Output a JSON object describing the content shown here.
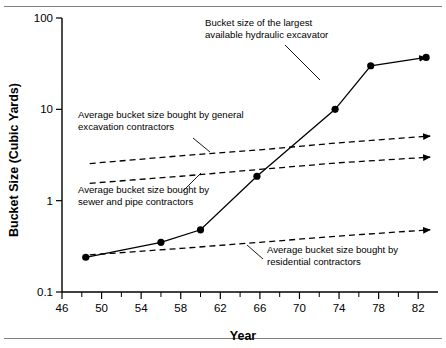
{
  "figure": {
    "name": "bucket-size-vs-year-chart",
    "background": "#ffffff",
    "rule_color": "#808080"
  },
  "chart_data": {
    "type": "line",
    "title": "",
    "xlabel": "Year",
    "ylabel": "Bucket Size (Cubic Yards)",
    "xlim": [
      46,
      84
    ],
    "ylim": [
      0.1,
      100
    ],
    "yscale": "log",
    "xscale": "linear",
    "grid": false,
    "legend": "none (inline annotations)",
    "x_major_ticks": [
      46,
      50,
      54,
      58,
      62,
      66,
      70,
      74,
      78,
      82
    ],
    "x_major_tick_labels": [
      "46",
      "50",
      "54",
      "58",
      "62",
      "66",
      "70",
      "74",
      "78",
      "82"
    ],
    "x_minor_ticks": [
      48,
      52,
      56,
      60,
      64,
      68,
      72,
      76,
      80
    ],
    "y_major_ticks": [
      0.1,
      1,
      10,
      100
    ],
    "y_major_tick_labels": [
      "0.1",
      "1",
      "10",
      "100"
    ],
    "series": [
      {
        "name": "Bucket size of the largest available hydraulic excavator",
        "style": "solid",
        "markers": true,
        "arrow": true,
        "x": [
          48.4,
          56,
          60,
          65.7,
          73.6,
          77.2,
          82.8
        ],
        "y": [
          0.24,
          0.35,
          0.48,
          1.85,
          10.0,
          30.0,
          37.0
        ]
      },
      {
        "name": "Average bucket size bought by general excavation contractors",
        "style": "dashed",
        "markers": false,
        "arrow": true,
        "x": [
          48.8,
          58,
          66,
          74,
          83.2
        ],
        "y": [
          2.55,
          3.1,
          3.6,
          4.3,
          5.1
        ]
      },
      {
        "name": "Average bucket size bought by sewer and pipe contractors",
        "style": "dashed",
        "markers": false,
        "arrow": true,
        "x": [
          48.8,
          58,
          66,
          74,
          83.2
        ],
        "y": [
          1.55,
          1.85,
          2.2,
          2.6,
          3.0
        ]
      },
      {
        "name": "Average bucket size bought by residential contractors",
        "style": "dashed",
        "markers": false,
        "arrow": true,
        "x": [
          48.8,
          58,
          66,
          74,
          83.2
        ],
        "y": [
          0.255,
          0.3,
          0.35,
          0.41,
          0.48
        ]
      }
    ],
    "annotations": [
      {
        "id": "annotation-largest-excavator",
        "line1": "Bucket size of the largest",
        "line2": "available hydraulic excavator",
        "text_x": 205,
        "text_y": 26,
        "leader": [
          285,
          45,
          320,
          80
        ]
      },
      {
        "id": "annotation-general-excavation",
        "line1": "Average bucket size bought by general",
        "line2": "excavation contractors",
        "text_x": 78,
        "text_y": 118,
        "leader": [
          193,
          138,
          210,
          152
        ]
      },
      {
        "id": "annotation-sewer-pipe",
        "line1": "Average bucket size bought by",
        "line2": "sewer and pipe contractors",
        "text_x": 78,
        "text_y": 193,
        "leader": [
          183,
          191,
          201,
          173
        ]
      },
      {
        "id": "annotation-residential",
        "line1": "Average bucket size bought by",
        "line2": "residential contractors",
        "text_x": 267,
        "text_y": 253,
        "leader": [
          247,
          245,
          263,
          259
        ]
      }
    ]
  },
  "axes": {
    "y_title": "Bucket Size (Cubic Yards)",
    "x_title": "Year"
  }
}
